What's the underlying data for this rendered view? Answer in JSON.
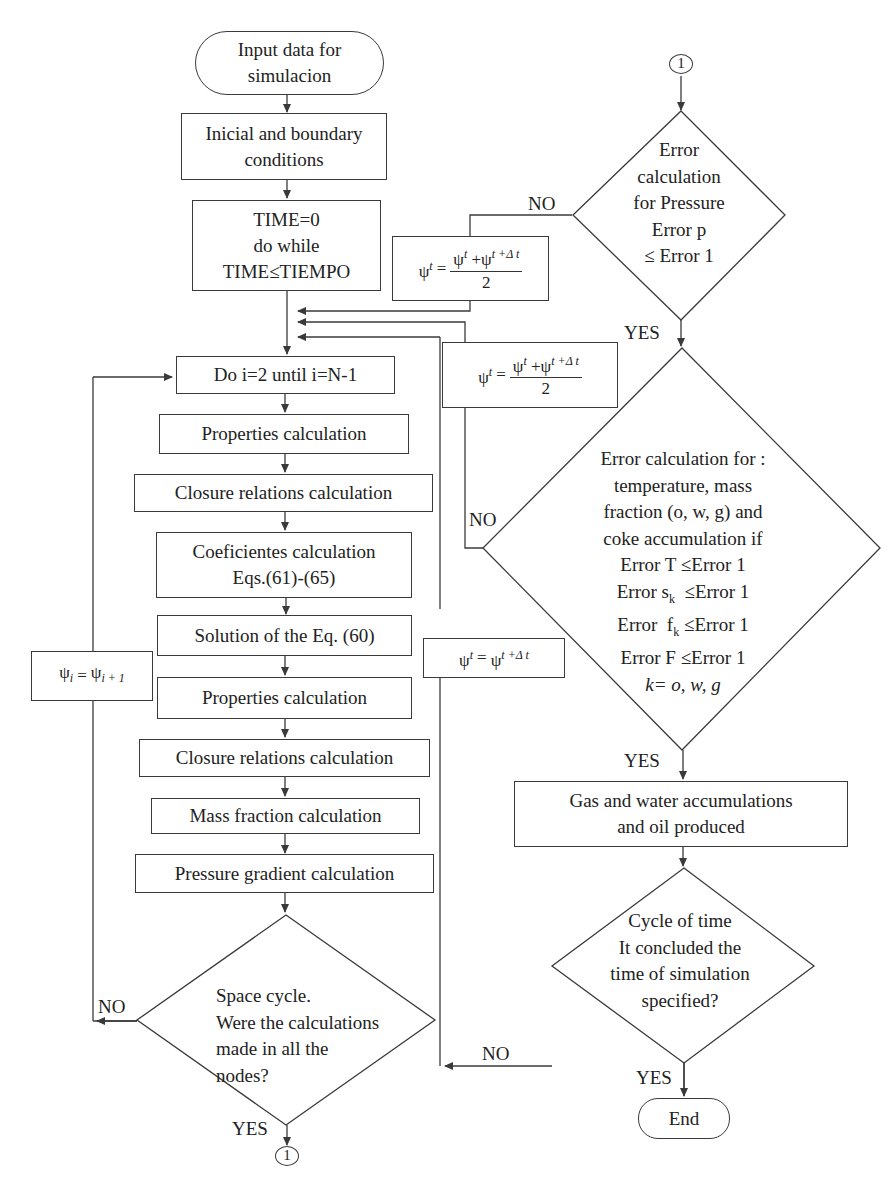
{
  "nodes": {
    "start": "Input data for\nsimulacion",
    "init": "Inicial and boundary\nconditions",
    "time_loop": "TIME=0\ndo while\nTIME≤TIEMPO",
    "do_loop": "Do i=2 until i=N-1",
    "props1": "Properties calculation",
    "closure1": "Closure relations calculation",
    "coef": "Coeficientes calculation\nEqs.(61)-(65)",
    "solution": "Solution of the Eq. (60)",
    "props2": "Properties calculation",
    "closure2": "Closure relations calculation",
    "mass_fraction": "Mass fraction calculation",
    "pressure_gradient": "Pressure gradient calculation",
    "space_cycle": "Space cycle.\nWere the calculations\nmade in all the\nnodes?",
    "connector_bottom": "1",
    "connector_top": "1",
    "pressure_error": "Error\ncalculation\nfor Pressure\nError p\n≤ Error 1",
    "multi_error_lines": [
      "Error calculation for :",
      "temperature, mass",
      "fraction (o, w, g) and",
      "coke accumulation if",
      "Error T  ≤Error 1",
      "Error s_k  ≤Error 1",
      "Error  f_k ≤Error 1",
      "Error F  ≤Error 1",
      "k= o, w, g"
    ],
    "accumulations": "Gas and water accumulations\nand oil produced",
    "time_cycle": "Cycle of time\nIt concluded the\ntime of simulation\nspecified?",
    "end": "End"
  },
  "formulas": {
    "avg_1": {
      "lhs": "ψ",
      "lhs_sup": "t",
      "eq": "=",
      "num_a": "ψ",
      "num_a_sup": "t",
      "plus": "+",
      "num_b": "ψ",
      "num_b_sup": "t +Δ t",
      "den": "2"
    },
    "avg_2": {
      "lhs": "ψ",
      "lhs_sup": "t",
      "eq": "=",
      "num_a": "ψ",
      "num_a_sup": "t",
      "plus": "+",
      "num_b": "ψ",
      "num_b_sup": "t +Δ t",
      "den": "2"
    },
    "advance": {
      "lhs": "ψ",
      "lhs_sup": "t",
      "eq": "=",
      "rhs": "ψ",
      "rhs_sup": "t +Δ  t"
    },
    "shift": {
      "lhs": "ψ",
      "lhs_sub": "i",
      "eq": "=",
      "rhs": "ψ",
      "rhs_sub": "i + 1"
    }
  },
  "labels": {
    "no_pressure": "NO",
    "yes_pressure": "YES",
    "no_multi": "NO",
    "yes_multi": "YES",
    "no_time": "NO",
    "yes_time": "YES",
    "no_space": "NO",
    "yes_space": "YES"
  },
  "colors": {
    "line": "#3a3a3a",
    "text": "#222222",
    "background": "#ffffff"
  }
}
